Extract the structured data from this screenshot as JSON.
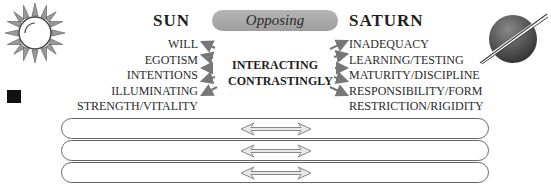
{
  "left": {
    "title": "SUN",
    "icon": "sun-icon",
    "keywords": [
      "WILL",
      "EGOTISM",
      "INTENTIONS",
      "ILLUMINATING",
      "STRENGTH/VITALITY"
    ]
  },
  "right": {
    "title": "SATURN",
    "icon": "saturn-icon",
    "keywords": [
      "INADEQUACY",
      "LEARNING/TESTING",
      "MATURITY/DISCIPLINE",
      "RESPONSIBILITY/FORM",
      "RESTRICTION/RIGIDITY"
    ]
  },
  "aspect": {
    "label": "Opposing",
    "center_line1": "INTERACTING",
    "center_line2": "CONTRASTINGLY"
  },
  "bars": [
    {
      "arrow": "double-arrow-icon"
    },
    {
      "arrow": "double-arrow-icon"
    },
    {
      "arrow": "double-arrow-icon"
    }
  ],
  "colors": {
    "pill": "#a8a8a8",
    "arrow": "#7a7a7a",
    "bullet": "#111111",
    "bar_border": "#666666"
  }
}
